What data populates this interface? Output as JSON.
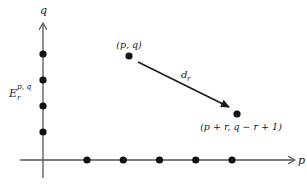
{
  "diagram": {
    "axes": {
      "vertical_label": "q",
      "horizontal_label": "p"
    },
    "page_label": {
      "base": "E",
      "sub": "r",
      "sup": "p, q"
    },
    "vertical_dots": 4,
    "horizontal_dots": 5,
    "source_point_label": "(p, q)",
    "target_point_label": "(p + r, q − r + 1)",
    "differential_label": {
      "base": "d",
      "sub": "r"
    }
  }
}
